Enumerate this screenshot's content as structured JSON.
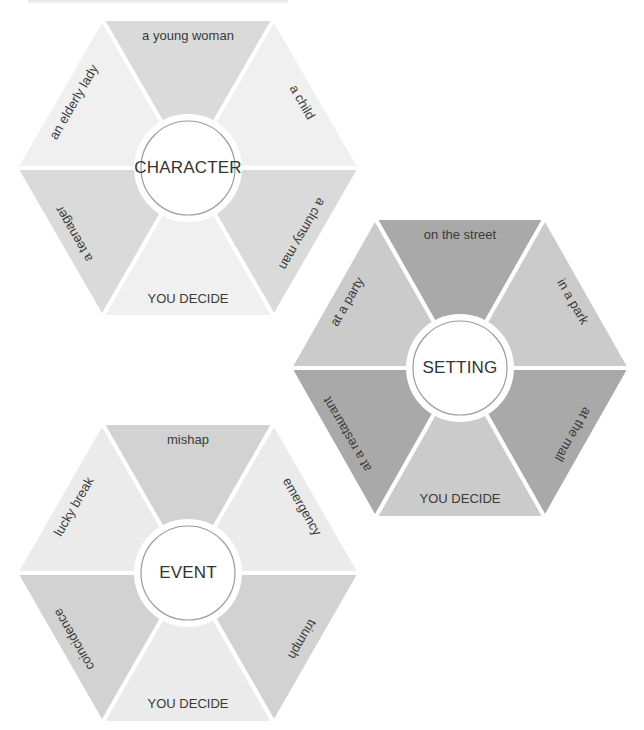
{
  "header": {
    "cut_off_text": ""
  },
  "wheels": [
    {
      "id": "character",
      "center_label": "CHARACTER",
      "center": [
        188,
        168
      ],
      "radius_x": 172,
      "half_height": 149,
      "segments": [
        {
          "position": "top",
          "label": "a young woman",
          "color": "#dadada"
        },
        {
          "position": "upper-right",
          "label": "a child",
          "color": "#f0f0f0"
        },
        {
          "position": "lower-right",
          "label": "a clumsy man",
          "color": "#dadada"
        },
        {
          "position": "bottom",
          "label": "YOU DECIDE",
          "color": "#f0f0f0"
        },
        {
          "position": "lower-left",
          "label": "a teenager",
          "color": "#dadada"
        },
        {
          "position": "upper-left",
          "label": "an elderly lady",
          "color": "#f0f0f0"
        }
      ]
    },
    {
      "id": "setting",
      "center_label": "SETTING",
      "center": [
        460,
        368
      ],
      "radius_x": 170,
      "half_height": 150,
      "segments": [
        {
          "position": "top",
          "label": "on the street",
          "color": "#a9a9a9"
        },
        {
          "position": "upper-right",
          "label": "in a park",
          "color": "#cbcbcb"
        },
        {
          "position": "lower-right",
          "label": "at the mall",
          "color": "#a9a9a9"
        },
        {
          "position": "bottom",
          "label": "YOU DECIDE",
          "color": "#cbcbcb"
        },
        {
          "position": "lower-left",
          "label": "at a restaurant",
          "color": "#a9a9a9"
        },
        {
          "position": "upper-left",
          "label": "at a party",
          "color": "#cbcbcb"
        }
      ]
    },
    {
      "id": "event",
      "center_label": "EVENT",
      "center": [
        188,
        573
      ],
      "radius_x": 172,
      "half_height": 150,
      "segments": [
        {
          "position": "top",
          "label": "mishap",
          "color": "#d2d2d2"
        },
        {
          "position": "upper-right",
          "label": "emergency",
          "color": "#ebebeb"
        },
        {
          "position": "lower-right",
          "label": "triumph",
          "color": "#d2d2d2"
        },
        {
          "position": "bottom",
          "label": "YOU DECIDE",
          "color": "#ebebeb"
        },
        {
          "position": "lower-left",
          "label": "coincidence",
          "color": "#d2d2d2"
        },
        {
          "position": "upper-left",
          "label": "lucky break",
          "color": "#ebebeb"
        }
      ]
    }
  ]
}
